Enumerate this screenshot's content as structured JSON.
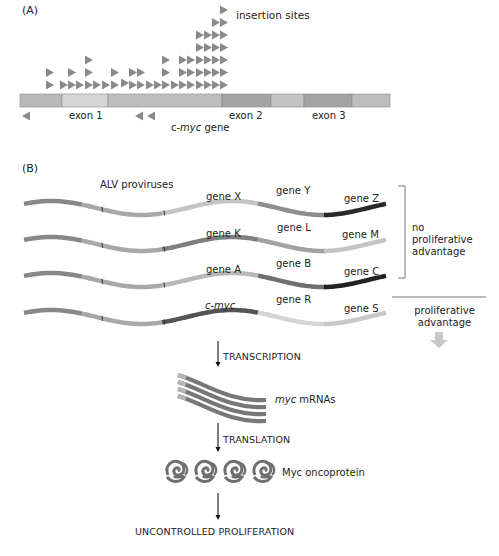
{
  "panel_a": {
    "label": "(A)",
    "insertion_sites_label": "insertion sites",
    "gene_label_prefix": "c-",
    "gene_label_italic": "myc",
    "gene_label_suffix": " gene",
    "exons": [
      "exon 1",
      "exon 2",
      "exon 3"
    ],
    "bar_segments": [
      {
        "x": 20,
        "w": 42,
        "color": "#b9b9b9"
      },
      {
        "x": 62,
        "w": 46,
        "color": "#d6d6d6"
      },
      {
        "x": 108,
        "w": 114,
        "color": "#bdbdbd"
      },
      {
        "x": 222,
        "w": 49,
        "color": "#a3a3a3"
      },
      {
        "x": 271,
        "w": 33,
        "color": "#c3c3c3"
      },
      {
        "x": 304,
        "w": 48,
        "color": "#a3a3a3"
      },
      {
        "x": 352,
        "w": 38,
        "color": "#bdbdbd"
      }
    ],
    "forward_insertion_columns": [
      {
        "x": 50,
        "count": 2
      },
      {
        "x": 64,
        "count": 1
      },
      {
        "x": 72,
        "count": 2
      },
      {
        "x": 80,
        "count": 1
      },
      {
        "x": 89,
        "count": 3
      },
      {
        "x": 97,
        "count": 1
      },
      {
        "x": 106,
        "count": 1
      },
      {
        "x": 115,
        "count": 2
      },
      {
        "x": 125,
        "count": 1,
        "offset": 2
      },
      {
        "x": 133,
        "count": 2
      },
      {
        "x": 141,
        "count": 2
      },
      {
        "x": 150,
        "count": 1
      },
      {
        "x": 158,
        "count": 1
      },
      {
        "x": 166,
        "count": 3
      },
      {
        "x": 175,
        "count": 1
      },
      {
        "x": 183,
        "count": 3
      },
      {
        "x": 191,
        "count": 3
      },
      {
        "x": 200,
        "count": 5
      },
      {
        "x": 208,
        "count": 5
      },
      {
        "x": 216,
        "count": 6
      },
      {
        "x": 224,
        "count": 7
      }
    ],
    "reverse_insertion_sites": [
      26,
      139,
      151
    ]
  },
  "panel_b": {
    "label": "(B)",
    "alv_label": "ALV proviruses",
    "rows": [
      {
        "genes": [
          "gene X",
          "gene Y",
          "gene Z"
        ],
        "colors": [
          "#c4c4c4",
          "#8e8e8e",
          "#2a2a2a"
        ]
      },
      {
        "genes": [
          "gene K",
          "gene L",
          "gene M"
        ],
        "colors": [
          "#7f7f7f",
          "#a2a2a2",
          "#c4c4c4"
        ]
      },
      {
        "genes": [
          "gene A",
          "gene B",
          "gene C"
        ],
        "colors": [
          "#b8b8b8",
          "#6f6f6f",
          "#222222"
        ]
      },
      {
        "genes": [
          "c-myc",
          "gene R",
          "gene S"
        ],
        "colors": [
          "#555555",
          "#d5d5d5",
          "#c8c8c8"
        ]
      }
    ],
    "no_advantage_label": [
      "no",
      "proliferative",
      "advantage"
    ],
    "advantage_label": [
      "proliferative",
      "advantage"
    ],
    "steps": {
      "transcription": "TRANSCRIPTION",
      "mrna_italic": "myc",
      "mrna_suffix": " mRNAs",
      "translation": "TRANSLATION",
      "protein": "Myc oncoprotein",
      "outcome": "UNCONTROLLED PROLIFERATION"
    },
    "mrna_count": 4,
    "protein_count": 4
  }
}
